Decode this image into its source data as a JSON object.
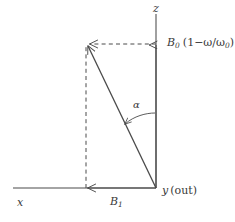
{
  "figure": {
    "width": 235,
    "height": 222,
    "background_color": "#ffffff",
    "line_color": "#4a4a4a",
    "text_color": "#3a3a3a"
  },
  "axes": {
    "vertical": {
      "name": "z-axis",
      "label": "z",
      "label_x": 156,
      "label_y": 6
    },
    "horizontal": {
      "name": "x-axis",
      "label": "x",
      "label_x": 20,
      "label_y": 199
    },
    "out_of_plane": {
      "name": "y-axis-out-of-page",
      "label_symbol": "y",
      "label_note": "(out)",
      "label_x": 163,
      "label_y": 190
    }
  },
  "vectors": {
    "b0": {
      "name": "B0-detuning-component",
      "symbol": "B",
      "subscript": "0",
      "expression": "(1−ω/ω",
      "expression_subscript": "0",
      "expression_close": ")",
      "full_label": "B0 (1−ω/ω0)",
      "direction": "up along z",
      "label_x": 168,
      "label_y": 40
    },
    "b1": {
      "name": "B1-rf-component",
      "symbol": "B",
      "subscript": "1",
      "full_label": "B1",
      "direction": "left along x",
      "label_x": 111,
      "label_y": 199
    },
    "effective": {
      "name": "effective-field-resultant",
      "description": "resultant vector from origin to tip",
      "tip_x": 86,
      "tip_y": 45
    }
  },
  "angle": {
    "name": "tip-angle-alpha",
    "label": "α",
    "label_x": 134,
    "label_y": 102,
    "between": "z-axis and effective field"
  },
  "geometry": {
    "origin_x": 156,
    "origin_y": 188,
    "z_axis_top_y": 14,
    "x_axis_left_x": 13,
    "corner_x": 86,
    "corner_y": 44
  }
}
